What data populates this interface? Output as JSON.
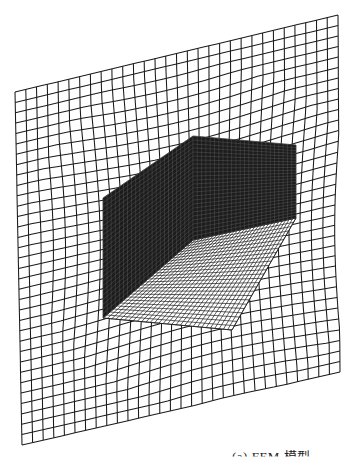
{
  "figure": {
    "stroke_color": "#1a1a1a",
    "wall_fill": "#1c1c1c",
    "background": "#ffffff"
  },
  "caption": {
    "text": "(a) FEM 模型"
  },
  "geometry": {
    "ground": {
      "far_left": [
        15,
        92
      ],
      "far_right": [
        338,
        15
      ],
      "near_left": [
        22,
        445
      ],
      "near_right": [
        340,
        372
      ],
      "rows": 34,
      "cols": 30
    },
    "back_wall_left": {
      "top_a": [
        103,
        198
      ],
      "top_b": [
        193,
        136
      ],
      "bot_a": [
        103,
        318
      ],
      "bot_b": [
        193,
        240
      ],
      "rows": 26,
      "cols": 22
    },
    "back_wall_right": {
      "top_a": [
        193,
        136
      ],
      "top_b": [
        296,
        145
      ],
      "bot_a": [
        193,
        240
      ],
      "bot_b": [
        296,
        218
      ],
      "rows": 26,
      "cols": 24
    },
    "box_floor": {
      "p1": [
        193,
        240
      ],
      "p2": [
        296,
        218
      ],
      "p3": [
        232,
        330
      ],
      "p4": [
        103,
        318
      ],
      "rows": 26,
      "cols": 30
    },
    "box_front": {
      "p1": [
        103,
        318
      ],
      "p2": [
        232,
        330
      ],
      "p3": [
        232,
        336
      ],
      "p4": [
        103,
        322
      ]
    }
  }
}
